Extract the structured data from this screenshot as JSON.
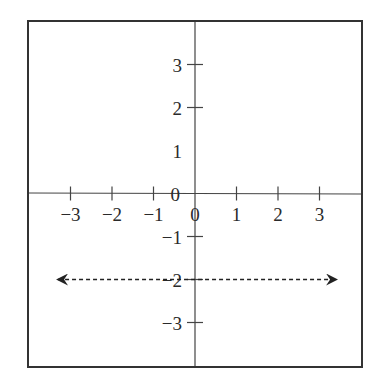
{
  "chart_data": {
    "type": "line",
    "title": "",
    "xlabel": "",
    "ylabel": "",
    "xlim": [
      -4,
      4
    ],
    "ylim": [
      -4,
      4
    ],
    "grid": false,
    "x_ticks": [
      -3,
      -2,
      -1,
      0,
      1,
      2,
      3
    ],
    "x_tick_labels": [
      "−3",
      "−2",
      "−1",
      "0",
      "1",
      "2",
      "3"
    ],
    "y_ticks": [
      3,
      2,
      -1,
      -2,
      -3
    ],
    "y_tick_labels": [
      {
        "value": 3,
        "label": "3"
      },
      {
        "value": 2,
        "label": "2"
      },
      {
        "value": 1,
        "label": "1"
      },
      {
        "value": 0,
        "label": "0"
      },
      {
        "value": -1,
        "label": "−1"
      },
      {
        "value": -2,
        "label": "−2"
      },
      {
        "value": -3,
        "label": "−3"
      }
    ],
    "series": [
      {
        "name": "y = -2",
        "style": "dashed",
        "arrows": "both",
        "x": [
          -3.3,
          3.4
        ],
        "values": [
          -2,
          -2
        ]
      }
    ]
  },
  "colors": {
    "axis": "#333333",
    "line": "#222222"
  }
}
